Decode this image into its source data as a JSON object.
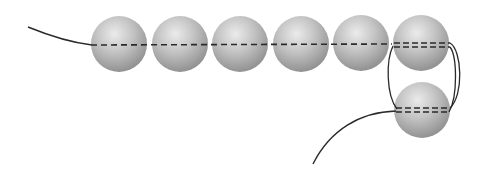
{
  "diagram": {
    "colors": {
      "background": "#ffffff",
      "thread": "#2a2a2a",
      "bead_light": "#e6e6e6",
      "bead_mid": "#b8b8b8",
      "bead_dark": "#8e8e8e"
    },
    "beads": [
      {
        "id": "bead-1",
        "cx": 119,
        "cy": 44,
        "r": 28
      },
      {
        "id": "bead-2",
        "cx": 180,
        "cy": 44,
        "r": 28
      },
      {
        "id": "bead-3",
        "cx": 240,
        "cy": 44,
        "r": 28
      },
      {
        "id": "bead-4",
        "cx": 301,
        "cy": 44,
        "r": 28
      },
      {
        "id": "bead-5",
        "cx": 361,
        "cy": 43,
        "r": 28
      },
      {
        "id": "bead-6",
        "cx": 421,
        "cy": 43,
        "r": 28
      },
      {
        "id": "bead-7",
        "cx": 422,
        "cy": 110,
        "r": 28
      }
    ],
    "thread_passes": {
      "row_passes": 1,
      "corner_bead_passes": 2,
      "lower_bead_passes": 2
    }
  }
}
